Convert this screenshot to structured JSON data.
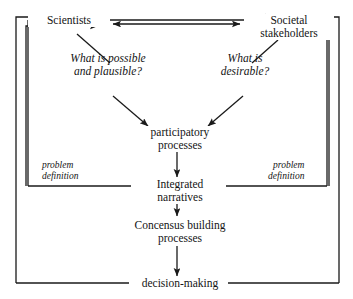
{
  "diagram": {
    "stroke_color": "#1a1a1a",
    "background_color": "#ffffff",
    "nodes": {
      "scientists": "Scientists",
      "stakeholders_line1": "Societal",
      "stakeholders_line2": "stakeholders",
      "question_left_line1": "What is possible",
      "question_left_line2": "and plausible?",
      "question_right_line1": "What is",
      "question_right_line2": "desirable?",
      "participatory_line1": "participatory",
      "participatory_line2": "processes",
      "integrated_line1": "Integrated",
      "integrated_line2": "narratives",
      "concensus_line1": "Concensus building",
      "concensus_line2": "processes",
      "decision_making": "decision-making"
    },
    "frame_labels": {
      "left_line1": "problem",
      "left_line2": "definition",
      "right_line1": "problem",
      "right_line2": "definition"
    }
  }
}
